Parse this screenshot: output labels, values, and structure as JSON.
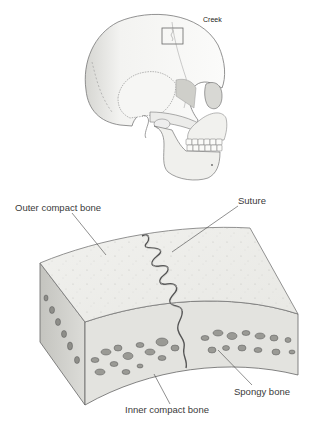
{
  "figure": {
    "type": "anatomical-illustration",
    "top_panel": {
      "subject": "human skull, lateral view",
      "annotation": "Creek",
      "inset_box": "suture detail region"
    },
    "bottom_panel": {
      "subject": "cross-section of skull bone at suture",
      "labels": {
        "outer_compact_bone": "Outer compact bone",
        "suture": "Suture",
        "spongy_bone": "Spongy bone",
        "inner_compact_bone": "Inner compact bone"
      }
    },
    "colors": {
      "background": "#ffffff",
      "line": "#555555",
      "bone_fill": "#ededea",
      "shade": "#c9c9c4",
      "cavity": "#8a8a86",
      "text": "#3a3a3a"
    }
  }
}
